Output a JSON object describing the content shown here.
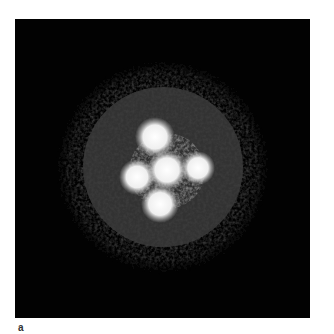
{
  "figure": {
    "panel_label": "a",
    "colors": {
      "background": "#ffffff",
      "panel": "#020202",
      "halo": "#3a3a3a",
      "spot": "#f2f2f2"
    },
    "halo": {
      "cx": 148,
      "cy": 148,
      "r_inner": 82,
      "r_outer": 110
    },
    "spots": [
      {
        "name": "top",
        "cx": 140,
        "cy": 118,
        "r": 17
      },
      {
        "name": "left",
        "cx": 122,
        "cy": 158,
        "r": 15
      },
      {
        "name": "center",
        "cx": 152,
        "cy": 151,
        "r": 17
      },
      {
        "name": "right",
        "cx": 183,
        "cy": 149,
        "r": 14
      },
      {
        "name": "bottom",
        "cx": 145,
        "cy": 185,
        "r": 16
      }
    ]
  }
}
